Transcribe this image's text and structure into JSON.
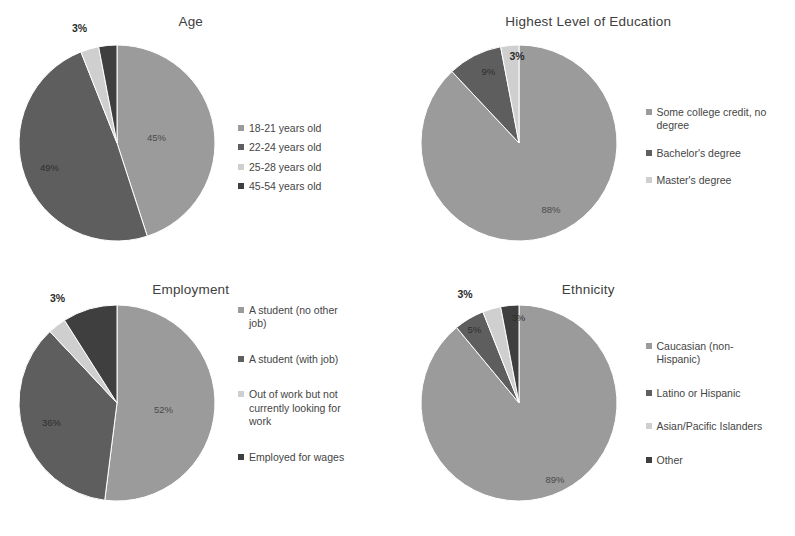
{
  "page": {
    "background": "#ffffff",
    "text_color": "#3b3b3b"
  },
  "palette": {
    "series1": "#9b9b9b",
    "series2": "#5e5e5e",
    "series3": "#cfcfcf",
    "series4": "#3f3f3f"
  },
  "charts": [
    {
      "id": "age",
      "title": "Age",
      "legend": [
        "18-21 years old",
        "22-24 years old",
        "25-28 years old",
        "45-54 years old"
      ]
    },
    {
      "id": "education",
      "title": "Highest Level of Education",
      "legend": [
        "Some college credit, no\ndegree",
        "Bachelor's degree",
        "Master's degree"
      ]
    },
    {
      "id": "employment",
      "title": "Employment",
      "legend": [
        "A student (no other\njob)",
        "A student (with job)",
        "Out of work but not\ncurrently looking for\nwork",
        "Employed for wages"
      ]
    },
    {
      "id": "ethnicity",
      "title": "Ethnicity",
      "legend": [
        "Caucasian (non-\nHispanic)",
        "Latino or Hispanic",
        "Asian/Pacific Islanders",
        "Other"
      ]
    }
  ],
  "labels": {
    "age": {
      "s1": "45%",
      "s2": "49%",
      "s3": "3%"
    },
    "education": {
      "s1": "88%",
      "s2": "9%",
      "s3": "3%"
    },
    "employment": {
      "s1": "52%",
      "s2": "36%",
      "s3": "3%"
    },
    "ethnicity": {
      "s1": "89%",
      "s2": "5%",
      "s3": "3%",
      "s4": "3%"
    }
  },
  "chart_data": [
    {
      "type": "pie",
      "title": "Age",
      "categories": [
        "18-21 years old",
        "22-24 years old",
        "25-28 years old",
        "45-54 years old"
      ],
      "values": [
        45,
        49,
        3,
        3
      ],
      "value_labels": [
        "45%",
        "49%",
        "3%",
        ""
      ],
      "colors": [
        "#9b9b9b",
        "#5e5e5e",
        "#cfcfcf",
        "#3f3f3f"
      ],
      "legend_position": "right",
      "start_angle_deg": 0,
      "direction": "clockwise"
    },
    {
      "type": "pie",
      "title": "Highest Level of Education",
      "categories": [
        "Some college credit, no degree",
        "Bachelor's degree",
        "Master's degree"
      ],
      "values": [
        88,
        9,
        3
      ],
      "value_labels": [
        "88%",
        "9%",
        "3%"
      ],
      "colors": [
        "#9b9b9b",
        "#5e5e5e",
        "#cfcfcf"
      ],
      "legend_position": "right",
      "start_angle_deg": 0,
      "direction": "clockwise"
    },
    {
      "type": "pie",
      "title": "Employment",
      "categories": [
        "A student (no other job)",
        "A student (with job)",
        "Out of work but not currently looking for work",
        "Employed for wages"
      ],
      "values": [
        52,
        36,
        3,
        9
      ],
      "value_labels": [
        "52%",
        "36%",
        "3%",
        ""
      ],
      "colors": [
        "#9b9b9b",
        "#5e5e5e",
        "#cfcfcf",
        "#3f3f3f"
      ],
      "legend_position": "right",
      "start_angle_deg": 0,
      "direction": "clockwise"
    },
    {
      "type": "pie",
      "title": "Ethnicity",
      "categories": [
        "Caucasian (non-Hispanic)",
        "Latino or Hispanic",
        "Asian/Pacific Islanders",
        "Other"
      ],
      "values": [
        89,
        5,
        3,
        3
      ],
      "value_labels": [
        "89%",
        "5%",
        "3%",
        "3%"
      ],
      "colors": [
        "#9b9b9b",
        "#5e5e5e",
        "#cfcfcf",
        "#3f3f3f"
      ],
      "legend_position": "right",
      "start_angle_deg": 0,
      "direction": "clockwise"
    }
  ]
}
